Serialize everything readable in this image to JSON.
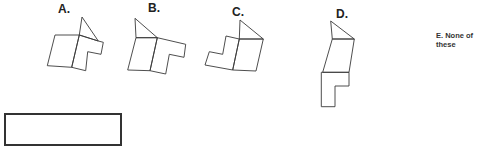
{
  "question": {
    "options": [
      {
        "id": "A",
        "label": "A."
      },
      {
        "id": "B",
        "label": "B."
      },
      {
        "id": "C",
        "label": "C."
      },
      {
        "id": "D",
        "label": "D."
      },
      {
        "id": "E",
        "label": "E. None of these"
      }
    ],
    "answer_box": {
      "value": ""
    }
  },
  "colors": {
    "stroke": "#3a3a3a",
    "label": "#222222",
    "background": "#ffffff"
  }
}
